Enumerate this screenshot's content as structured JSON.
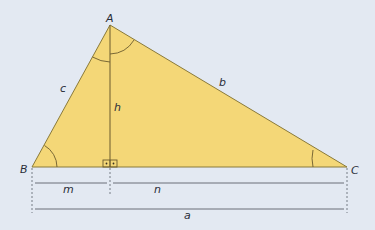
{
  "diagram": {
    "type": "right-triangle-altitude",
    "colors": {
      "background": "#e3e9f2",
      "triangle_fill": "#f4d777",
      "edge": "#8a7a3a",
      "altitude": "#6b5b2e",
      "dimension_line": "#6a6f78",
      "text": "#2a2e38"
    },
    "vertices": {
      "A": {
        "label": "A",
        "x": 110,
        "y": 25
      },
      "B": {
        "label": "B",
        "x": 32,
        "y": 167
      },
      "C": {
        "label": "C",
        "x": 347,
        "y": 167
      },
      "H": {
        "x": 110,
        "y": 167
      }
    },
    "sides": {
      "a": "a",
      "b": "b",
      "c": "c",
      "h": "h",
      "m": "m",
      "n": "n"
    }
  }
}
